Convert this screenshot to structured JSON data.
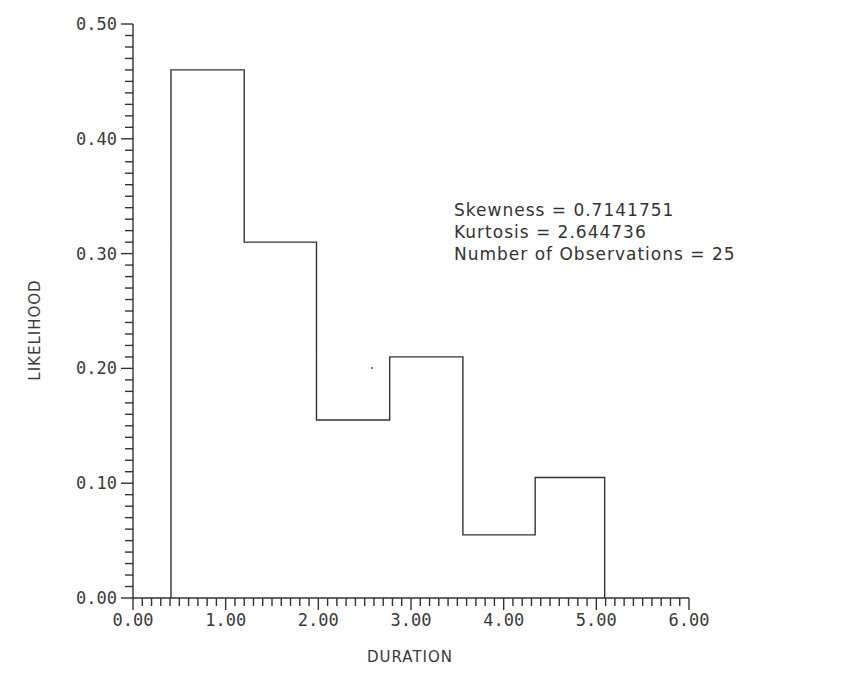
{
  "chart_data": {
    "type": "bar",
    "subtype": "histogram",
    "title": "",
    "xlabel": "DURATION",
    "ylabel": "LIKELIHOOD",
    "xlim": [
      0,
      6
    ],
    "ylim": [
      0,
      0.5
    ],
    "x_ticks": [
      "0.00",
      "1.00",
      "2.00",
      "3.00",
      "4.00",
      "5.00",
      "6.00"
    ],
    "y_ticks": [
      "0.00",
      "0.10",
      "0.20",
      "0.30",
      "0.40",
      "0.50"
    ],
    "x_minor_per_major": 10,
    "y_minor_per_major": 10,
    "grid": false,
    "bin_edges": [
      0.41,
      1.2,
      1.98,
      2.77,
      3.56,
      4.34,
      5.09
    ],
    "values": [
      0.46,
      0.31,
      0.155,
      0.21,
      0.055,
      0.105
    ],
    "annotations": [
      "Skewness = 0.7141751",
      "Kurtosis = 2.644736",
      "Number of Observations = 25"
    ]
  },
  "stats": {
    "skewness": "Skewness = 0.7141751",
    "kurtosis": "Kurtosis = 2.644736",
    "observations": "Number of Observations = 25"
  },
  "axes": {
    "xlabel": "DURATION",
    "ylabel": "LIKELIHOOD"
  },
  "colors": {
    "line": "#333333",
    "background": "#ffffff"
  }
}
